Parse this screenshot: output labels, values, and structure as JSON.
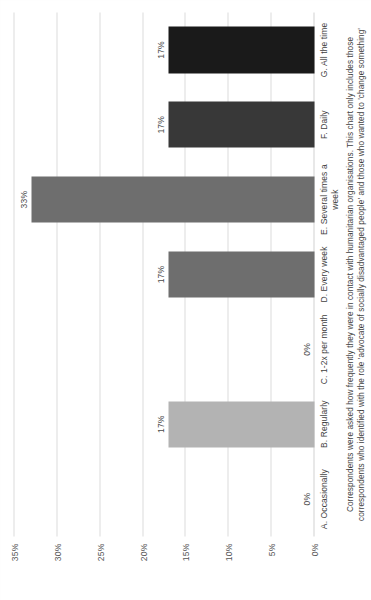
{
  "chart_data": {
    "type": "bar",
    "title": "",
    "subtitle": "",
    "xlabel": "",
    "ylabel": "",
    "categories": [
      "A. Occasionally",
      "B. Regularly",
      "C. 1-2x per month",
      "D. Every week",
      "E. Several times a week",
      "F. Daily",
      "G. All the time"
    ],
    "values": [
      0,
      17,
      0,
      17,
      33,
      17,
      17
    ],
    "value_labels": [
      "0%",
      "17%",
      "0%",
      "17%",
      "33%",
      "17%",
      "17%"
    ],
    "bar_colors": [
      "#b3b3b3",
      "#b3b3b3",
      "#8c8c8c",
      "#6e6e6e",
      "#6e6e6e",
      "#383838",
      "#1a1a1a"
    ],
    "ylim": [
      0,
      35
    ],
    "yticks": [
      0,
      5,
      10,
      15,
      20,
      25,
      30,
      35
    ],
    "ytick_labels": [
      "0%",
      "5%",
      "10%",
      "15%",
      "20%",
      "25%",
      "30%",
      "35%"
    ],
    "grid": true,
    "legend": "none",
    "annotation": "Correspondents were asked how frequently they were in contact with humanitarian organisations. This chart only includes those correspondents who identified with the role 'advocate of socially disadvantaged people' and those who wanted to 'change something'"
  },
  "page": {
    "background_color": "#ffffff",
    "grid_color": "#dcdcdc",
    "text_color": "#3f3f3f",
    "rotation_degrees": -90
  }
}
